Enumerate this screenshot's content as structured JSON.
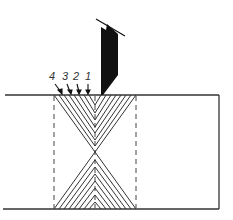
{
  "diagram": {
    "type": "weld pass sequence cross-section",
    "pass_labels": [
      "4",
      "3",
      "2",
      "1"
    ],
    "colors": {
      "line": "#333333",
      "tool": "#111111",
      "background": "#ffffff"
    }
  }
}
